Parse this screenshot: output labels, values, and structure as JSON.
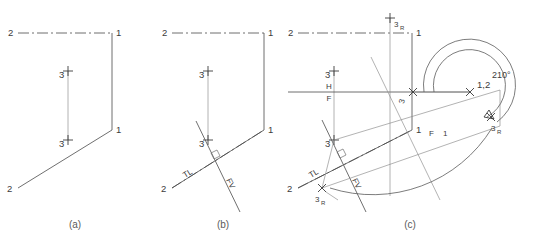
{
  "figure": {
    "background": "#ffffff",
    "line_color": "#4a4a4a",
    "text_color": "#3c3c3c"
  },
  "captions": {
    "a": "(a)",
    "b": "(b)",
    "c": "(c)"
  },
  "panel_a": {
    "name": "panel-a",
    "labels": {
      "top_left_2": "2",
      "top_right_1": "1",
      "mid_right_1": "1",
      "bottom_left_2": "2",
      "point_3_top": "3",
      "point_3_bottom": "3"
    }
  },
  "panel_b": {
    "name": "panel-b",
    "labels": {
      "top_left_2": "2",
      "top_right_1": "1",
      "mid_right_1": "1",
      "bottom_left_2": "2",
      "point_3_top": "3",
      "point_3_bottom": "3",
      "true_length": "TL",
      "frontal_view": "FV"
    }
  },
  "panel_c": {
    "name": "panel-c",
    "labels": {
      "top_left_2": "2",
      "top_right_1": "1",
      "mid_right_1": "1",
      "bottom_left_2": "2",
      "point_3_top": "3",
      "point_3_bottom": "3",
      "point_3_center": "3",
      "true_length": "TL",
      "frontal_view": "FV",
      "horizontal_plane": "H",
      "frontal_plane": "F",
      "fold_line_f": "F",
      "fold_line_1": "1",
      "point_1_2": "1,2",
      "rot_3r_top": "3",
      "rot_3r_top_sub": "R",
      "rot_3r_right": "3",
      "rot_3r_right_sub": "R",
      "rot_3r_bottom": "3",
      "rot_3r_bottom_sub": "R",
      "angle": "210°"
    }
  }
}
